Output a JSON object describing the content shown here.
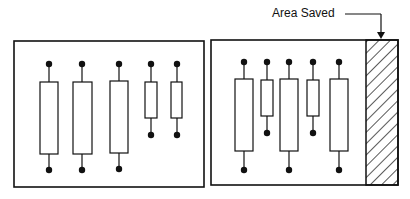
{
  "annotation": {
    "label": "Area Saved",
    "arrow": "points-down-to-hatched-area"
  },
  "colors": {
    "ink": "#111111",
    "background": "#ffffff"
  },
  "boards": [
    {
      "name": "original-layout",
      "box": {
        "x": 14,
        "y": 41,
        "w": 190,
        "h": 146
      },
      "components": [
        {
          "cx": 49,
          "size": "long",
          "rect": {
            "x": 40,
            "y": 82,
            "w": 18,
            "h": 72
          },
          "top_pin_y": 64,
          "bottom_pin_y": 170
        },
        {
          "cx": 82,
          "size": "long",
          "rect": {
            "x": 73,
            "y": 82,
            "w": 19,
            "h": 72
          },
          "top_pin_y": 64,
          "bottom_pin_y": 170
        },
        {
          "cx": 119,
          "size": "long",
          "rect": {
            "x": 110,
            "y": 81,
            "w": 18,
            "h": 72
          },
          "top_pin_y": 64,
          "bottom_pin_y": 169
        },
        {
          "cx": 151,
          "size": "short",
          "rect": {
            "x": 145,
            "y": 82,
            "w": 12,
            "h": 36
          },
          "top_pin_y": 64,
          "bottom_pin_y": 135
        },
        {
          "cx": 177,
          "size": "short",
          "rect": {
            "x": 171,
            "y": 82,
            "w": 11,
            "h": 36
          },
          "top_pin_y": 64,
          "bottom_pin_y": 135
        }
      ]
    },
    {
      "name": "optimized-layout",
      "box": {
        "x": 211,
        "y": 40,
        "w": 187,
        "h": 145
      },
      "hatched_area": {
        "x": 366,
        "y": 40,
        "w": 32,
        "h": 145
      },
      "components": [
        {
          "cx": 244,
          "size": "long",
          "rect": {
            "x": 235,
            "y": 79,
            "w": 18,
            "h": 72
          },
          "top_pin_y": 62,
          "bottom_pin_y": 170
        },
        {
          "cx": 267,
          "size": "short",
          "rect": {
            "x": 261,
            "y": 80,
            "w": 12,
            "h": 36
          },
          "top_pin_y": 62,
          "bottom_pin_y": 133
        },
        {
          "cx": 289,
          "size": "long",
          "rect": {
            "x": 280,
            "y": 79,
            "w": 18,
            "h": 72
          },
          "top_pin_y": 62,
          "bottom_pin_y": 170
        },
        {
          "cx": 313,
          "size": "short",
          "rect": {
            "x": 307,
            "y": 80,
            "w": 12,
            "h": 36
          },
          "top_pin_y": 62,
          "bottom_pin_y": 133
        },
        {
          "cx": 339,
          "size": "long",
          "rect": {
            "x": 330,
            "y": 79,
            "w": 18,
            "h": 72
          },
          "top_pin_y": 62,
          "bottom_pin_y": 170
        }
      ]
    }
  ]
}
